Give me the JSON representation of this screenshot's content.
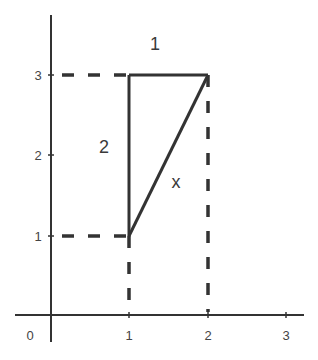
{
  "diagram": {
    "type": "coordinate-geometry",
    "axes": {
      "x_ticks": [
        "0",
        "1",
        "2",
        "3"
      ],
      "y_ticks": [
        "1",
        "2",
        "3"
      ]
    },
    "triangle": {
      "vertices": [
        [
          1,
          1
        ],
        [
          1,
          3
        ],
        [
          2,
          3
        ]
      ],
      "side_labels": {
        "top": "1",
        "left": "2",
        "hypotenuse": "x"
      }
    },
    "guides": "dashed projection lines from (1,1),(1,3),(2,3) to axes",
    "colors": {
      "line": "#333333",
      "text": "#444444",
      "background": "#ffffff"
    }
  }
}
